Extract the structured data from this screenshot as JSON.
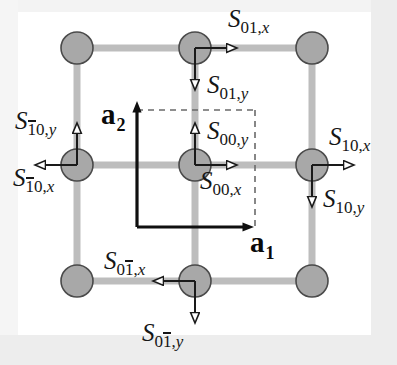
{
  "figure": {
    "kind": "lattice-spin-diagram",
    "canvas": {
      "width": 397,
      "height": 365
    },
    "colors": {
      "background": "#ffffff",
      "frame": "#ededed",
      "site_fill": "#a8a8a8",
      "site_stroke": "#4a4a4a",
      "bond": "#bdbdbd",
      "arrow": "#1a1a1a",
      "dashed_cell": "#555555",
      "text": "#161616"
    },
    "lattice": {
      "columns_x": [
        77,
        195,
        312
      ],
      "rows_y": [
        48,
        165,
        281
      ],
      "site_radius": 16,
      "bond_width": 7
    },
    "unit_cell": {
      "origin": [
        137,
        227
      ],
      "corner": [
        255,
        110
      ],
      "style": "dashed"
    }
  },
  "vectors": [
    {
      "name": "a1",
      "letter": "a",
      "index": "1",
      "x": 252,
      "y": 232,
      "direction": "right"
    },
    {
      "name": "a2",
      "letter": "a",
      "index": "2",
      "x": 102,
      "y": 104,
      "direction": "up"
    }
  ],
  "spin_labels": [
    {
      "name": "S-01-x",
      "base": "S",
      "cell": "01",
      "overbar": "",
      "comp": "x",
      "x": 228,
      "y": 12,
      "arrow": "right"
    },
    {
      "name": "S-01-y",
      "base": "S",
      "cell": "01",
      "overbar": "",
      "comp": "y",
      "x": 207,
      "y": 78,
      "arrow": "down"
    },
    {
      "name": "S-00-y",
      "base": "S",
      "cell": "00",
      "overbar": "",
      "comp": "y",
      "x": 207,
      "y": 124,
      "arrow": "up"
    },
    {
      "name": "S-00-x",
      "base": "S",
      "cell": "00",
      "overbar": "",
      "comp": "x",
      "x": 203,
      "y": 172,
      "arrow": "right"
    },
    {
      "name": "S-10-x",
      "base": "S",
      "cell": "10",
      "overbar": "",
      "comp": "x",
      "x": 330,
      "y": 130,
      "arrow": "right"
    },
    {
      "name": "S-10-y",
      "base": "S",
      "cell": "10",
      "overbar": "",
      "comp": "y",
      "x": 324,
      "y": 190,
      "arrow": "down"
    },
    {
      "name": "S-m10-y",
      "base": "S",
      "cell": "10",
      "overbar": "1",
      "comp": "y",
      "x": 16,
      "y": 113,
      "arrow": "up"
    },
    {
      "name": "S-m10-x",
      "base": "S",
      "cell": "10",
      "overbar": "1",
      "comp": "x",
      "x": 14,
      "y": 170,
      "arrow": "left"
    },
    {
      "name": "S-0m1-x",
      "base": "S",
      "cell": "01",
      "overbar": "2",
      "comp": "x",
      "x": 105,
      "y": 253,
      "arrow": "left"
    },
    {
      "name": "S-0m1-y",
      "base": "S",
      "cell": "01",
      "overbar": "2",
      "comp": "y",
      "x": 143,
      "y": 326,
      "arrow": "down"
    }
  ],
  "label_text": {
    "S_01_x": {
      "S": "S",
      "sub_pre": "01,",
      "sub_comp": "x"
    },
    "S_01_y": {
      "S": "S",
      "sub_pre": "01,",
      "sub_comp": "y"
    },
    "S_00_y": {
      "S": "S",
      "sub_pre": "00,",
      "sub_comp": "y"
    },
    "S_00_x": {
      "S": "S",
      "sub_pre": "00,",
      "sub_comp": "x"
    },
    "S_10_x": {
      "S": "S",
      "sub_pre": "10,",
      "sub_comp": "x"
    },
    "S_10_y": {
      "S": "S",
      "sub_pre": "10,",
      "sub_comp": "y"
    },
    "S_m10_y": {
      "S": "S",
      "sub_bar": "1",
      "sub_mid": "0,",
      "sub_comp": "y"
    },
    "S_m10_x": {
      "S": "S",
      "sub_bar": "1",
      "sub_mid": "0,",
      "sub_comp": "x"
    },
    "S_0m1_x": {
      "S": "S",
      "sub_pre": "0",
      "sub_bar": "1",
      "sub_mid": ",",
      "sub_comp": "x"
    },
    "S_0m1_y": {
      "S": "S",
      "sub_pre": "0",
      "sub_bar": "1",
      "sub_mid": ",",
      "sub_comp": "y"
    },
    "a1": {
      "a": "a",
      "sub": "1"
    },
    "a2": {
      "a": "a",
      "sub": "2"
    }
  }
}
